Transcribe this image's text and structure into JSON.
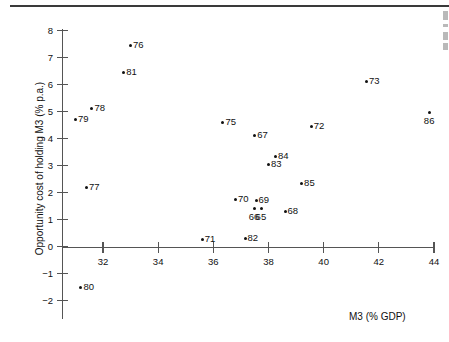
{
  "chart_data": {
    "type": "scatter",
    "title": "",
    "xlabel": "M3 (% GDP)",
    "ylabel": "Opportunity cost of holding M3 (% p.a.)",
    "xlim": [
      30.4,
      44.4
    ],
    "ylim": [
      -2,
      8
    ],
    "xticks": [
      32,
      34,
      36,
      38,
      40,
      42,
      44
    ],
    "xtick_labels": [
      "32",
      "34",
      "36",
      "38",
      "40",
      "42",
      "44"
    ],
    "yticks": [
      8,
      7,
      6,
      5,
      4,
      3,
      2,
      1,
      0,
      -1,
      -2
    ],
    "ytick_labels": [
      "8",
      "7",
      "6",
      "5",
      "4",
      "3",
      "2",
      "1",
      "0",
      "−1",
      "−2"
    ],
    "grid": false,
    "legend": false,
    "points": [
      {
        "label": "76",
        "x": 33.0,
        "y": 7.45,
        "label_pos": "right"
      },
      {
        "label": "81",
        "x": 32.75,
        "y": 6.45,
        "label_pos": "right"
      },
      {
        "label": "73",
        "x": 41.55,
        "y": 6.1,
        "label_pos": "right"
      },
      {
        "label": "78",
        "x": 31.6,
        "y": 5.1,
        "label_pos": "right"
      },
      {
        "label": "79",
        "x": 31.0,
        "y": 4.7,
        "label_pos": "right"
      },
      {
        "label": "86",
        "x": 43.85,
        "y": 4.95,
        "label_pos": "below"
      },
      {
        "label": "75",
        "x": 36.35,
        "y": 4.6,
        "label_pos": "right"
      },
      {
        "label": "72",
        "x": 39.55,
        "y": 4.45,
        "label_pos": "right"
      },
      {
        "label": "67",
        "x": 37.5,
        "y": 4.1,
        "label_pos": "right"
      },
      {
        "label": "84",
        "x": 38.25,
        "y": 3.35,
        "label_pos": "right"
      },
      {
        "label": "83",
        "x": 38.0,
        "y": 3.05,
        "label_pos": "right"
      },
      {
        "label": "85",
        "x": 39.2,
        "y": 2.35,
        "label_pos": "right"
      },
      {
        "label": "77",
        "x": 31.4,
        "y": 2.2,
        "label_pos": "right"
      },
      {
        "label": "70",
        "x": 36.8,
        "y": 1.75,
        "label_pos": "right"
      },
      {
        "label": "69",
        "x": 37.55,
        "y": 1.7,
        "label_pos": "right"
      },
      {
        "label": "66",
        "x": 37.5,
        "y": 1.4,
        "label_pos": "below"
      },
      {
        "label": "65",
        "x": 37.75,
        "y": 1.4,
        "label_pos": "below"
      },
      {
        "label": "68",
        "x": 38.6,
        "y": 1.3,
        "label_pos": "right"
      },
      {
        "label": "82",
        "x": 37.15,
        "y": 0.3,
        "label_pos": "right"
      },
      {
        "label": "71",
        "x": 35.6,
        "y": 0.25,
        "label_pos": "right"
      },
      {
        "label": "80",
        "x": 31.2,
        "y": -1.5,
        "label_pos": "right"
      }
    ]
  }
}
